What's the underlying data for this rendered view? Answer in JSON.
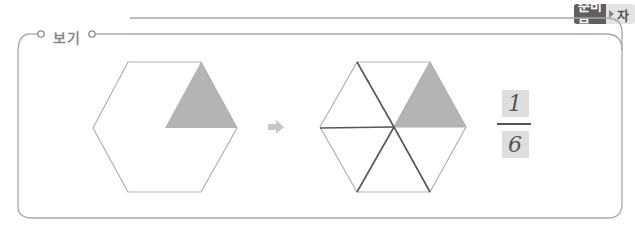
{
  "badge": {
    "label_dark": "준비물",
    "label_light": "자",
    "arrow_icon": "play-triangle-icon"
  },
  "example": {
    "title": "보기",
    "arrow_icon": "right-arrow-icon"
  },
  "figures": {
    "hexagon_before": {
      "shaded_parts": 1,
      "total_parts": 6,
      "divided": false
    },
    "hexagon_after": {
      "shaded_parts": 1,
      "total_parts": 6,
      "divided": true
    }
  },
  "fraction": {
    "numerator": "1",
    "denominator": "6"
  },
  "colors": {
    "frame": "#a8a8a8",
    "shade": "#b4b4b4",
    "badge_dark": "#5f5f5f",
    "badge_light": "#e4e4e4",
    "arrow": "#c8c8c8",
    "pencil_line": "#555555"
  }
}
